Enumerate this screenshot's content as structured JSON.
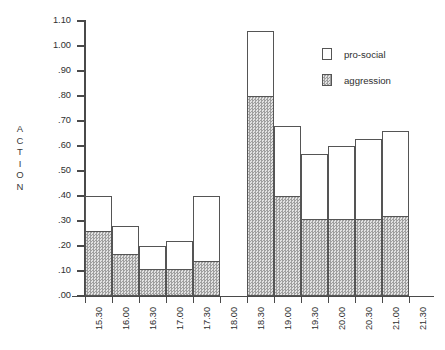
{
  "chart_data": {
    "type": "bar",
    "stacked": true,
    "title": "",
    "xlabel": "",
    "ylabel": "ACTION",
    "ylim": [
      0.0,
      1.1
    ],
    "ytick_values": [
      0.0,
      0.1,
      0.2,
      0.3,
      0.4,
      0.5,
      0.6,
      0.7,
      0.8,
      0.9,
      1.0,
      1.1
    ],
    "ytick_labels": [
      ".00",
      ".10",
      ".20",
      ".30",
      ".40",
      ".50",
      ".60",
      ".70",
      ".80",
      ".90",
      "1.00",
      "1.10"
    ],
    "categories": [
      "15.30",
      "16.00",
      "16.30",
      "17.00",
      "17.30",
      "18.00",
      "18.30",
      "19.00",
      "19.30",
      "20.00",
      "20.30",
      "21.00",
      "21.30"
    ],
    "grid": false,
    "legend_position": "top-right",
    "series": [
      {
        "name": "aggression",
        "color": "#bdbdbd",
        "fill": "hatched",
        "values": [
          0.26,
          0.17,
          0.11,
          0.11,
          0.14,
          null,
          0.8,
          0.4,
          0.31,
          0.31,
          0.31,
          0.32,
          null
        ]
      },
      {
        "name": "pro-social",
        "color": "#ffffff",
        "fill": "empty",
        "values": [
          0.14,
          0.11,
          0.09,
          0.11,
          0.26,
          null,
          0.26,
          0.28,
          0.26,
          0.29,
          0.32,
          0.34,
          null
        ]
      }
    ],
    "totals": [
      0.4,
      0.28,
      0.2,
      0.22,
      0.4,
      null,
      1.06,
      0.68,
      0.57,
      0.6,
      0.63,
      0.66,
      null
    ],
    "bars": [
      {
        "category": "15.30",
        "total": 0.4,
        "aggression": 0.26,
        "pro_social": 0.14
      },
      {
        "category": "16.00",
        "total": 0.28,
        "aggression": 0.17,
        "pro_social": 0.11
      },
      {
        "category": "16.30",
        "total": 0.2,
        "aggression": 0.11,
        "pro_social": 0.09
      },
      {
        "category": "17.00",
        "total": 0.22,
        "aggression": 0.11,
        "pro_social": 0.11
      },
      {
        "category": "17.30",
        "total": 0.4,
        "aggression": 0.14,
        "pro_social": 0.26
      },
      {
        "category": "18.30",
        "total": 1.06,
        "aggression": 0.8,
        "pro_social": 0.26
      },
      {
        "category": "19.00",
        "total": 0.68,
        "aggression": 0.4,
        "pro_social": 0.28
      },
      {
        "category": "19.30",
        "total": 0.57,
        "aggression": 0.31,
        "pro_social": 0.26
      },
      {
        "category": "20.00",
        "total": 0.6,
        "aggression": 0.31,
        "pro_social": 0.29
      },
      {
        "category": "20.30",
        "total": 0.63,
        "aggression": 0.31,
        "pro_social": 0.32
      },
      {
        "category": "21.00",
        "total": 0.66,
        "aggression": 0.32,
        "pro_social": 0.34
      }
    ]
  },
  "axis": {
    "y_title_letters": [
      "A",
      "C",
      "T",
      "I",
      "O",
      "N"
    ]
  },
  "legend": {
    "items": [
      {
        "label": "pro-social",
        "swatch": "empty-box-icon"
      },
      {
        "label": "aggression",
        "swatch": "hatched-box-icon"
      }
    ]
  }
}
